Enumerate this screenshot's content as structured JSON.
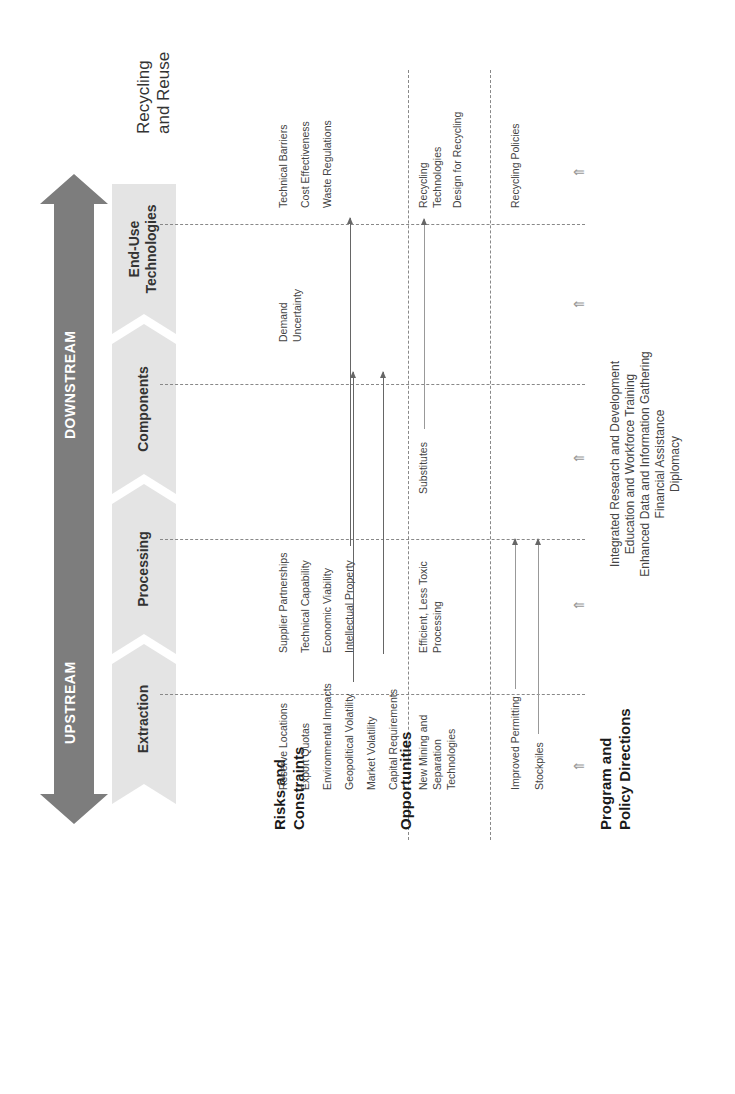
{
  "flow_arrow": {
    "upstream_label": "UPSTREAM",
    "downstream_label": "DOWNSTREAM",
    "color": "#7a7a7a"
  },
  "stages": [
    {
      "label": "Extraction"
    },
    {
      "label": "Processing"
    },
    {
      "label": "Components"
    },
    {
      "label_line1": "End-Use",
      "label_line2": "Technologies"
    },
    {
      "label_line1": "Recycling",
      "label_line2": "and Reuse"
    }
  ],
  "rows": {
    "risks": {
      "label_line1": "Risks and",
      "label_line2": "Constraints",
      "extraction": [
        "Reserve Locations",
        "Export Quotas",
        "Environmental Impacts",
        "Geopolitical Volatility",
        "Market Volatility",
        "Capital Requirements"
      ],
      "processing": [
        "Supplier Partnerships",
        "Technical Capability",
        "Economic Viability",
        "Intellectual Property"
      ],
      "end_use": [
        "Demand",
        "Uncertainty"
      ],
      "recycling": [
        "Technical Barriers",
        "Cost Effectiveness",
        "Waste Regulations"
      ]
    },
    "opportunities": {
      "label": "Opportunities",
      "extraction": [
        "New Mining and",
        "Separation",
        "Technologies"
      ],
      "processing": [
        "Efficient, Less Toxic",
        "Processing"
      ],
      "components": [
        "Substitutes"
      ],
      "recycling": [
        "Recycling",
        "Technologies",
        "Design for Recycling"
      ]
    },
    "program": {
      "label_line1": "Program and",
      "label_line2": "Policy Directions",
      "extraction": [
        "Improved Permitting",
        "Stockpiles"
      ],
      "recycling": [
        "Recycling Policies"
      ],
      "cross_cutting": [
        "Integrated Research and Development",
        "Education and Workforce Training",
        "Enhanced Data and Information Gathering",
        "Financial Assistance",
        "Diplomacy"
      ]
    }
  },
  "colors": {
    "chevron_fill": "#e4e4e4",
    "arrow_fill": "#7d7d7d",
    "divider": "#888888"
  }
}
